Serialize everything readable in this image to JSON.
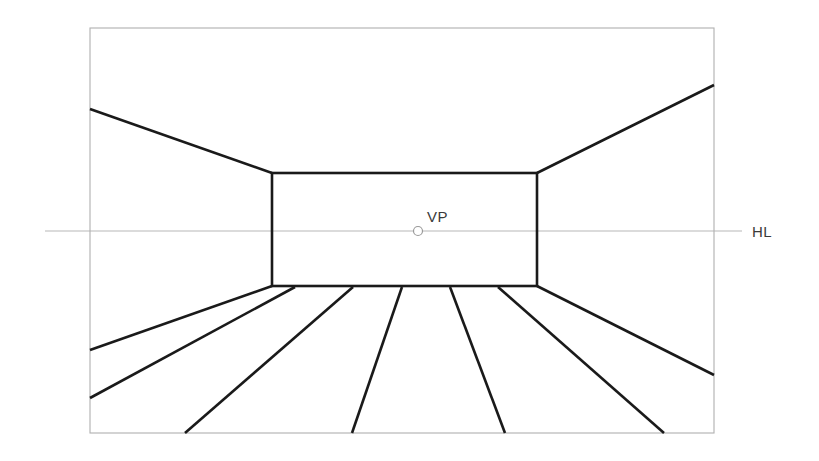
{
  "canvas": {
    "width": 819,
    "height": 461,
    "background": "#ffffff"
  },
  "diagram": {
    "type": "line-drawing"
  },
  "colors": {
    "frame_stroke": "#b0b0b0",
    "horizon_stroke": "#b8b8b8",
    "construction_stroke": "#1a1a1a",
    "label_fill": "#3a3a3a",
    "vp_marker_stroke": "#9a9a9a",
    "background": "#ffffff"
  },
  "labels": {
    "vanishing_point": "VP",
    "horizon_line": "HL"
  },
  "geometry": {
    "picture_frame": {
      "x1": 90,
      "y1": 28,
      "x2": 714,
      "y2": 433,
      "stroke_width": 1.1
    },
    "inner_rectangle": {
      "x1": 272,
      "y1": 173,
      "x2": 537,
      "y2": 286,
      "stroke_width": 2.6
    },
    "horizon_line": {
      "x1": 45,
      "y1": 231,
      "x2": 742,
      "y2": 231,
      "stroke_width": 1.1
    },
    "vanishing_point": {
      "cx": 418,
      "cy": 231,
      "r": 4.5,
      "stroke_width": 1.2
    },
    "vp_label_pos": {
      "x": 427,
      "y": 222
    },
    "hl_label_pos": {
      "x": 752,
      "y": 237
    },
    "ceiling_lines": [
      {
        "name": "ceiling-left",
        "x1": 90,
        "y1": 109,
        "x2": 272,
        "y2": 173
      },
      {
        "name": "ceiling-right",
        "x1": 714,
        "y1": 85,
        "x2": 537,
        "y2": 173
      }
    ],
    "floor_lines": [
      {
        "name": "floor-left-outer",
        "x1": 272,
        "y1": 286,
        "x2": 90,
        "y2": 350
      },
      {
        "name": "floor-left-mid",
        "x1": 295,
        "y1": 287,
        "x2": 90,
        "y2": 398
      },
      {
        "name": "floor-left-inner",
        "x1": 353,
        "y1": 287,
        "x2": 185,
        "y2": 433
      },
      {
        "name": "floor-center",
        "x1": 402,
        "y1": 287,
        "x2": 352,
        "y2": 433
      },
      {
        "name": "floor-right-inner",
        "x1": 450,
        "y1": 287,
        "x2": 505,
        "y2": 433
      },
      {
        "name": "floor-right-mid",
        "x1": 498,
        "y1": 287,
        "x2": 664,
        "y2": 433
      },
      {
        "name": "floor-right-outer",
        "x1": 537,
        "y1": 286,
        "x2": 714,
        "y2": 375
      }
    ],
    "construction_stroke_width": 2.6
  }
}
